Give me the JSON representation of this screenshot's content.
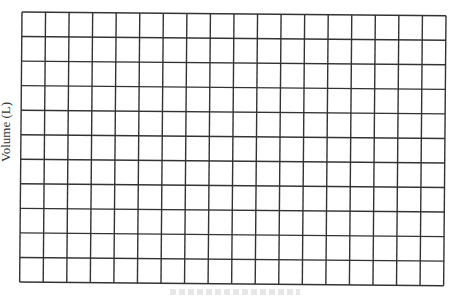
{
  "chart_data": {
    "type": "grid",
    "title": "",
    "ylabel": "Volume (L)",
    "xlabel": "",
    "grid": true,
    "columns": 18,
    "rows": 11,
    "line_color": "#333333",
    "background": "#ffffff",
    "series": []
  }
}
